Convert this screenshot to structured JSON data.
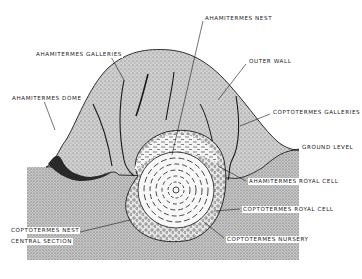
{
  "diagram": {
    "type": "cross-section illustration",
    "labels": [
      {
        "id": "ahamitermes_nest",
        "text": "AHAMITERMES NEST",
        "x": 204,
        "y": 18
      },
      {
        "id": "ahamitermes_galleries",
        "text": "AHAMITERMES GALLERIES",
        "x": 35,
        "y": 54
      },
      {
        "id": "outer_wall",
        "text": "OUTER WALL",
        "x": 248,
        "y": 61
      },
      {
        "id": "ahamitermes_dome",
        "text": "AHAMITERMES DOME",
        "x": 11,
        "y": 97
      },
      {
        "id": "coptotermes_galleries",
        "text": "COPTOTERMES GALLERIES",
        "x": 272,
        "y": 111
      },
      {
        "id": "ground_level",
        "text": "GROUND LEVEL",
        "x": 301,
        "y": 144
      },
      {
        "id": "ahamitermes_royal_cell",
        "text": "AHAMITERMES ROYAL CELL",
        "x": 248,
        "y": 178
      },
      {
        "id": "coptotermes_royal_cell",
        "text": "COPTOTERMES ROYAL CELL",
        "x": 242,
        "y": 206
      },
      {
        "id": "coptotermes_nest_central_section_1",
        "text": "COPTOTERMES NEST",
        "x": 10,
        "y": 227
      },
      {
        "id": "coptotermes_nest_central_section_2",
        "text": "CENTRAL SECTION",
        "x": 10,
        "y": 238
      },
      {
        "id": "coptotermes_nursery",
        "text": "COPTOTERMES NURSERY",
        "x": 226,
        "y": 236
      }
    ],
    "colors": {
      "background": "#ffffff",
      "ground_fill": "#b8b8b8",
      "mound_fill": "#c4c4c4",
      "nest_fill": "#f2f2f2",
      "line": "#1a1a1a"
    }
  }
}
